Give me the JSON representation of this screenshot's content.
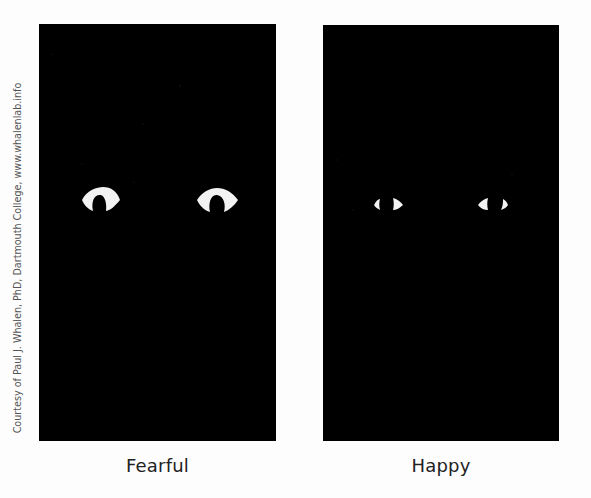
{
  "figure": {
    "credit": "Courtesy of Paul J. Whalen, PhD, Dartmouth College, www.whalenlab.info",
    "panels": [
      {
        "id": "fearful",
        "label": "Fearful",
        "background": "#000000",
        "eye_color": "#f2f2f2",
        "description": "Isolated eye whites (sclera) of a fearful face; large widened eyes shown as horseshoe shapes"
      },
      {
        "id": "happy",
        "label": "Happy",
        "background": "#000000",
        "eye_color": "#f2f2f2",
        "description": "Isolated eye whites (sclera) of a happy face; small triangular slivers on either side of the iris"
      }
    ]
  }
}
